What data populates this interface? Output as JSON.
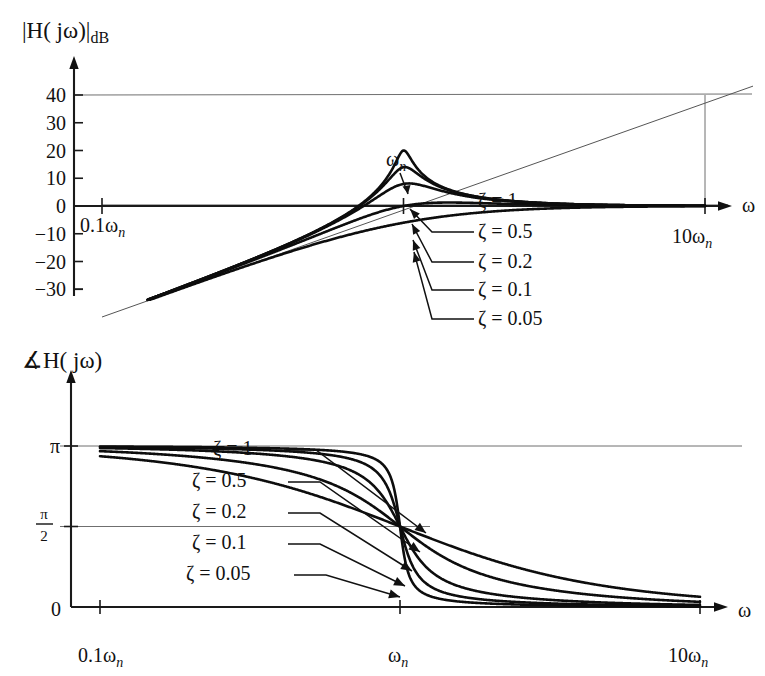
{
  "figure": {
    "kind": "bode-plot",
    "background": "#ffffff",
    "ink_color": "#111111",
    "grid_color": "#6f6f6f"
  },
  "magnitude_plot": {
    "title": "|H( jω)|",
    "title_sub": "dB",
    "x_axis_label": "ω",
    "y_ticks": [
      "40",
      "30",
      "20",
      "10",
      "0",
      "-10",
      "-20",
      "-30"
    ],
    "y_tick_values": [
      40,
      30,
      20,
      10,
      0,
      -10,
      -20,
      -30
    ],
    "x_ticks": [
      {
        "label_main": "0.1ω",
        "label_sub": "n",
        "value": 0.1
      },
      {
        "label_main": "ω",
        "label_sub": "n",
        "value": 1
      },
      {
        "label_main": "10ω",
        "label_sub": "n",
        "value": 10
      }
    ],
    "wn_callout": {
      "main": "ω",
      "sub": "n"
    },
    "zeta_labels": [
      {
        "text": "ζ = 1",
        "zeta": 1.0
      },
      {
        "text": "ζ = 0.5",
        "zeta": 0.5
      },
      {
        "text": "ζ = 0.2",
        "zeta": 0.2
      },
      {
        "text": "ζ = 0.1",
        "zeta": 0.1
      },
      {
        "text": "ζ = 0.05",
        "zeta": 0.05
      }
    ]
  },
  "phase_plot": {
    "title_angle_symbol": "∡",
    "title": "H( jω)",
    "x_axis_label": "ω",
    "y_ticks": [
      {
        "label": "π",
        "value": 3.14159
      },
      {
        "label": "π/2",
        "numerator": "π",
        "denominator": "2",
        "value": 1.5708
      },
      {
        "label": "0",
        "value": 0
      }
    ],
    "x_ticks": [
      {
        "label_main": "0.1ω",
        "label_sub": "n",
        "value": 0.1
      },
      {
        "label_main": "ω",
        "label_sub": "n",
        "value": 1
      },
      {
        "label_main": "10ω",
        "label_sub": "n",
        "value": 10
      }
    ],
    "zeta_labels": [
      {
        "text": "ζ = 1",
        "zeta": 1.0
      },
      {
        "text": "ζ = 0.5",
        "zeta": 0.5
      },
      {
        "text": "ζ = 0.2",
        "zeta": 0.2
      },
      {
        "text": "ζ = 0.1",
        "zeta": 0.1
      },
      {
        "text": "ζ = 0.05",
        "zeta": 0.05
      }
    ]
  },
  "chart_data": {
    "type": "line",
    "subplots": [
      {
        "name": "magnitude",
        "title": "|H( jω)|dB",
        "xlabel": "ω",
        "ylabel": "|H( jω)|dB",
        "xscale": "log",
        "xlim": [
          0.1,
          10
        ],
        "ylim": [
          -30,
          45
        ],
        "xtick_labels": [
          "0.1ωn",
          "ωn",
          "10ωn"
        ],
        "xtick_values": [
          0.1,
          1,
          10
        ],
        "ytick_labels": [
          "40",
          "30",
          "20",
          "10",
          "0",
          "-10",
          "-20",
          "-30"
        ],
        "ytick_values": [
          40,
          30,
          20,
          10,
          0,
          -10,
          -20,
          -30
        ],
        "grid": "horizontal-at-40-and-0",
        "legend": "inline-callouts",
        "transfer_function": "H(s) = s^2 / (s^2 + 2*zeta*wn*s + wn^2)",
        "series": [
          {
            "name": "ζ = 1",
            "zeta": 1.0,
            "x": [
              0.1,
              0.2,
              0.3,
              0.5,
              0.7,
              1.0,
              1.5,
              2.0,
              3.0,
              5.0,
              10.0
            ],
            "values_db": [
              -40.1,
              -28.3,
              -21.7,
              -13.8,
              -9.2,
              -6.0,
              -2.7,
              -1.1,
              0.7,
              1.7,
              1.9
            ]
          },
          {
            "name": "ζ = 0.5",
            "zeta": 0.5,
            "x": [
              0.1,
              0.2,
              0.3,
              0.5,
              0.7,
              1.0,
              1.5,
              2.0,
              3.0,
              5.0,
              10.0
            ],
            "values_db": [
              -40.0,
              -28.1,
              -21.1,
              -12.5,
              -6.9,
              0.0,
              3.9,
              2.7,
              1.3,
              1.9,
              2.0
            ]
          },
          {
            "name": "ζ = 0.2",
            "zeta": 0.2,
            "x": [
              0.1,
              0.2,
              0.3,
              0.5,
              0.7,
              0.9,
              1.0,
              1.1,
              1.5,
              2.0,
              3.0,
              5.0,
              10.0
            ],
            "values_db": [
              -40.0,
              -28.0,
              -20.9,
              -11.9,
              -5.0,
              5.6,
              8.0,
              5.3,
              1.2,
              1.0,
              1.7,
              2.0,
              2.0
            ]
          },
          {
            "name": "ζ = 0.1",
            "zeta": 0.1,
            "x": [
              0.1,
              0.2,
              0.3,
              0.5,
              0.7,
              0.9,
              1.0,
              1.1,
              1.5,
              2.0,
              3.0,
              5.0,
              10.0
            ],
            "values_db": [
              -40.0,
              -28.0,
              -20.8,
              -11.7,
              -4.1,
              8.3,
              14.0,
              6.6,
              0.9,
              1.0,
              1.7,
              2.0,
              2.0
            ]
          },
          {
            "name": "ζ = 0.05",
            "zeta": 0.05,
            "x": [
              0.1,
              0.2,
              0.3,
              0.5,
              0.7,
              0.9,
              1.0,
              1.1,
              1.5,
              2.0,
              3.0,
              5.0,
              10.0
            ],
            "values_db": [
              -40.0,
              -28.0,
              -20.8,
              -11.6,
              -3.8,
              10.0,
              20.0,
              7.0,
              0.8,
              1.0,
              1.7,
              2.0,
              2.0
            ]
          }
        ],
        "asymptotes": [
          {
            "name": "40 dB reference line",
            "y_db": 40,
            "x": [
              0.1,
              10
            ]
          },
          {
            "name": "+40 dB/decade low-frequency asymptote",
            "points": [
              [
                0.1,
                -40
              ],
              [
                10,
                40
              ]
            ]
          },
          {
            "name": "0 dB high-frequency asymptote",
            "y_db": 0,
            "x": [
              0.1,
              10
            ]
          }
        ]
      },
      {
        "name": "phase",
        "title": "∡H( jω)",
        "xlabel": "ω",
        "ylabel": "∡H( jω)",
        "xscale": "log",
        "xlim": [
          0.1,
          10
        ],
        "ylim": [
          0,
          3.4
        ],
        "xtick_labels": [
          "0.1ωn",
          "ωn",
          "10ωn"
        ],
        "xtick_values": [
          0.1,
          1,
          10
        ],
        "ytick_labels": [
          "0",
          "π/2",
          "π"
        ],
        "ytick_values": [
          0,
          1.5708,
          3.14159
        ],
        "grid": "horizontal-at-pi-and-pi-over-2",
        "legend": "inline-callouts",
        "series": [
          {
            "name": "ζ = 1",
            "zeta": 1.0,
            "x": [
              0.1,
              0.2,
              0.3,
              0.5,
              0.7,
              1.0,
              1.5,
              2.0,
              3.0,
              5.0,
              10.0
            ],
            "values_rad": [
              0.201,
              0.409,
              0.629,
              1.08,
              1.44,
              1.571,
              2.06,
              2.4,
              2.72,
              2.94,
              3.04
            ]
          },
          {
            "name": "ζ = 0.5",
            "zeta": 0.5,
            "x": [
              0.1,
              0.2,
              0.3,
              0.5,
              0.7,
              1.0,
              1.5,
              2.0,
              3.0,
              5.0,
              10.0
            ],
            "values_rad": [
              0.101,
              0.204,
              0.313,
              0.556,
              0.834,
              1.571,
              2.25,
              2.59,
              2.9,
              3.04,
              3.1
            ]
          },
          {
            "name": "ζ = 0.2",
            "zeta": 0.2,
            "x": [
              0.1,
              0.2,
              0.3,
              0.5,
              0.7,
              0.9,
              1.0,
              1.1,
              1.5,
              2.0,
              3.0,
              5.0,
              10.0
            ],
            "values_rad": [
              0.04,
              0.081,
              0.124,
              0.215,
              0.322,
              0.755,
              1.571,
              2.34,
              2.75,
              2.9,
              3.02,
              3.09,
              3.12
            ]
          },
          {
            "name": "ζ = 0.1",
            "zeta": 0.1,
            "x": [
              0.1,
              0.2,
              0.3,
              0.5,
              0.7,
              0.9,
              1.0,
              1.1,
              1.5,
              2.0,
              3.0,
              5.0,
              10.0
            ],
            "values_rad": [
              0.02,
              0.04,
              0.062,
              0.107,
              0.157,
              0.444,
              1.571,
              2.72,
              2.95,
              3.02,
              3.08,
              3.12,
              3.13
            ]
          },
          {
            "name": "ζ = 0.05",
            "zeta": 0.05,
            "x": [
              0.1,
              0.2,
              0.3,
              0.5,
              0.7,
              0.9,
              1.0,
              1.1,
              1.5,
              2.0,
              3.0,
              5.0,
              10.0
            ],
            "values_rad": [
              0.01,
              0.02,
              0.031,
              0.053,
              0.078,
              0.248,
              1.571,
              2.9,
              3.05,
              3.08,
              3.11,
              3.13,
              3.14
            ]
          }
        ]
      }
    ]
  }
}
